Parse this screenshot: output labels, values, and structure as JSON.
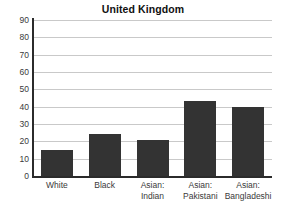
{
  "chart_data": {
    "type": "bar",
    "title": "United Kingdom",
    "xlabel": "",
    "ylabel": "",
    "categories": [
      "White",
      "Black",
      "Asian:\nIndian",
      "Asian:\nPakistani",
      "Asian:\nBangladeshi"
    ],
    "values": [
      15,
      24,
      21,
      43,
      40
    ],
    "ylim": [
      0,
      90
    ],
    "yticks": [
      0,
      10,
      20,
      30,
      40,
      50,
      60,
      70,
      80,
      90
    ],
    "ytick_labels": [
      "0",
      "10",
      "20",
      "30",
      "40",
      "50",
      "60",
      "70",
      "80",
      "90"
    ],
    "grid": true,
    "grid_axis": "y",
    "legend": false,
    "legend_position": "none",
    "colors": {
      "bar": "#333333",
      "gridline": "#c9c9c9",
      "axis": "#2b2b2b",
      "background": "#ffffff",
      "text": "#3a3a3a",
      "title": "#111111"
    }
  }
}
